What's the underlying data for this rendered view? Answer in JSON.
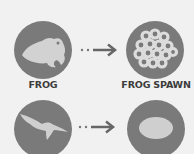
{
  "diagram": {
    "rows": [
      {
        "from": {
          "label": "FROG",
          "icon": "frog-icon"
        },
        "to": {
          "label": "FROG SPAWN",
          "icon": "frog-spawn-icon"
        },
        "connector": "dotted-arrow"
      },
      {
        "from": {
          "label": "",
          "icon": "bird-icon"
        },
        "to": {
          "label": "",
          "icon": "egg-icon"
        },
        "connector": "dotted-arrow"
      }
    ]
  },
  "colors": {
    "background": "#f1f1f1",
    "circle": "#7a7a7a",
    "icon": "#cfcfcf",
    "arrow": "#666666",
    "label": "#3c3c3c"
  }
}
